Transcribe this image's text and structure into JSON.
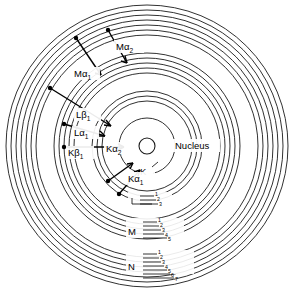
{
  "figure": {
    "background_color": "#ffffff",
    "line_color": "#1a1a1a",
    "center": {
      "x": 147,
      "y": 146
    }
  },
  "nucleus": {
    "label": "Nucleus",
    "radius": 8
  },
  "shells": [
    {
      "name": "K",
      "label": "K",
      "sublevel_count": 1,
      "radius": 30,
      "sublevels": [
        "K"
      ]
    },
    {
      "name": "L",
      "label": "L",
      "sublevel_count": 3,
      "radius": 52,
      "sublevels": [
        "1",
        "2",
        "3"
      ]
    },
    {
      "name": "M",
      "label": "M",
      "sublevel_count": 5,
      "radius": 83,
      "sublevels": [
        "1",
        "2",
        "3",
        "4",
        "5"
      ]
    },
    {
      "name": "N",
      "label": "N",
      "sublevel_count": 7,
      "radius": 118,
      "sublevels": [
        "1",
        "2",
        "3",
        "4",
        "5",
        "6",
        "7"
      ]
    }
  ],
  "transitions": [
    {
      "id": "k-alpha-1",
      "base": "K",
      "greek": "α",
      "sub": "1",
      "label": "Kα",
      "subscript": "1",
      "from_shell": "L",
      "to_shell": "K"
    },
    {
      "id": "k-alpha-2",
      "base": "K",
      "greek": "α",
      "sub": "2",
      "label": "Kα",
      "subscript": "2",
      "from_shell": "L",
      "to_shell": "K"
    },
    {
      "id": "k-beta-1",
      "base": "K",
      "greek": "β",
      "sub": "1",
      "label": "Kβ",
      "subscript": "1",
      "from_shell": "M",
      "to_shell": "K"
    },
    {
      "id": "l-alpha-1",
      "base": "L",
      "greek": "α",
      "sub": "1",
      "label": "Lα",
      "subscript": "1",
      "from_shell": "M",
      "to_shell": "L"
    },
    {
      "id": "l-beta-1",
      "base": "L",
      "greek": "β",
      "sub": "1",
      "label": "Lβ",
      "subscript": "1",
      "from_shell": "N",
      "to_shell": "L"
    },
    {
      "id": "m-alpha-1",
      "base": "M",
      "greek": "α",
      "sub": "1",
      "label": "Mα",
      "subscript": "1",
      "from_shell": "N",
      "to_shell": "M"
    },
    {
      "id": "m-alpha-2",
      "base": "M",
      "greek": "α",
      "sub": "2",
      "label": "Mα",
      "subscript": "2",
      "from_shell": "N",
      "to_shell": "M"
    }
  ]
}
